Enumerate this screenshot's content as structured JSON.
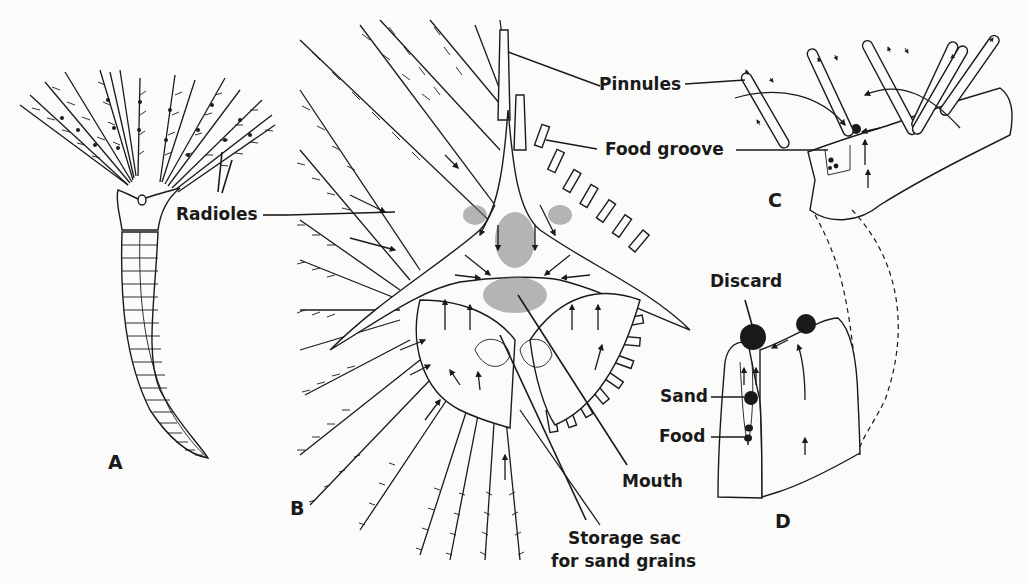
{
  "figure": {
    "panels": {
      "a": "A",
      "b": "B",
      "c": "C",
      "d": "D"
    },
    "labels": {
      "radioles": "Radioles",
      "pinnules": "Pinnules",
      "food_groove": "Food groove",
      "discard": "Discard",
      "sand": "Sand",
      "food": "Food",
      "mouth": "Mouth",
      "storage_sac_line1": "Storage sac",
      "storage_sac_line2": "for sand grains"
    },
    "colors": {
      "ink": "#1a1a1a",
      "paper": "#fbfbf9"
    }
  }
}
